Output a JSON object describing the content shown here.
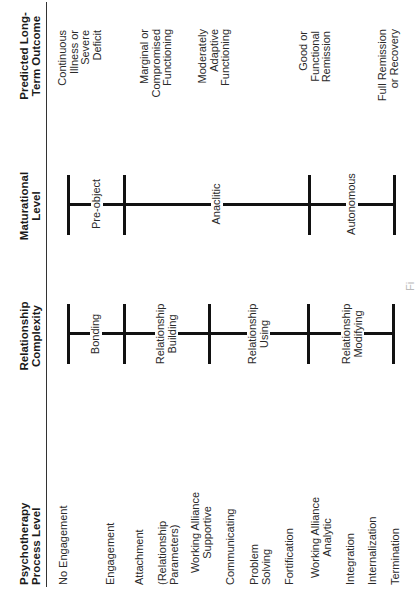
{
  "headers": {
    "process": "Psychotherapy Process Level",
    "relationship": "Relationship Complexity",
    "maturational": "Maturational Level",
    "outcome": "Predicted Long-Term Outcome"
  },
  "process_levels": [
    {
      "label": "No Engagement"
    },
    {
      "label": "Engagement"
    },
    {
      "label": "Attachment"
    },
    {
      "label": "(Relationship Parameters)"
    },
    {
      "label": "Working Alliance Supportive"
    },
    {
      "label": "Communicating"
    },
    {
      "label": "Problem Solving"
    },
    {
      "label": "Fortification"
    },
    {
      "label": "Working Alliance Analytic"
    },
    {
      "label": "Integration"
    },
    {
      "label": "Internalization"
    },
    {
      "label": "Termination"
    }
  ],
  "relationship_stages": [
    {
      "label": "Bonding"
    },
    {
      "label": "Relationship Building"
    },
    {
      "label": "Relationship Using"
    },
    {
      "label": "Relationship Modifying"
    }
  ],
  "maturational_stages": [
    {
      "label": "Pre-object"
    },
    {
      "label": "Anaclitic"
    },
    {
      "label": "Autonomous"
    }
  ],
  "outcomes": [
    {
      "label": "Continuous Illness or Severe Deficit"
    },
    {
      "label": "Marginal or Compromised Functioning"
    },
    {
      "label": "Moderately Adaptive Functioning"
    },
    {
      "label": "Good or Functional Remission"
    },
    {
      "label": "Full Remission or Recovery"
    }
  ],
  "caption": "Fi"
}
